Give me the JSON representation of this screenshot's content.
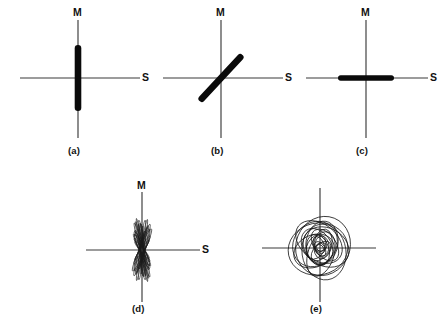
{
  "figure": {
    "background_color": "#ffffff",
    "line_color": "#3a3a3a",
    "mark_color": "#0a0a0a",
    "axis_label_vertical": "M",
    "axis_label_horizontal": "S"
  },
  "panels": [
    {
      "id": "a",
      "caption": "(a)",
      "label_m": "M",
      "label_s": "S",
      "description": "linear vertical particle motion",
      "motion_type": "linear",
      "orientation_deg": 90
    },
    {
      "id": "b",
      "caption": "(b)",
      "label_m": "M",
      "label_s": "S",
      "description": "linear oblique particle motion at about 45 degrees",
      "motion_type": "linear",
      "orientation_deg": 47
    },
    {
      "id": "c",
      "caption": "(c)",
      "label_m": "M",
      "label_s": "S",
      "description": "linear horizontal particle motion",
      "motion_type": "linear",
      "orientation_deg": 0
    },
    {
      "id": "d",
      "caption": "(d)",
      "label_m": "M",
      "label_s": "S",
      "description": "fan of narrow near-linear ellipses about the vertical axis",
      "motion_type": "near-linear-ellipses",
      "orientation_deg": 90
    },
    {
      "id": "e",
      "caption": "(e)",
      "label_m": "",
      "label_s": "",
      "description": "many overlapping elliptical and circular orbits",
      "motion_type": "elliptical-orbits",
      "orientation_deg": null
    }
  ],
  "chart_data": {
    "type": "scatter",
    "xlabel": "S",
    "ylabel": "M",
    "grid": false,
    "legend": "none",
    "panel_axes": {
      "a": {
        "x_min": -58,
        "x_max": 62,
        "y_min": -62,
        "y_max": 56
      },
      "b": {
        "x_min": -58,
        "x_max": 62,
        "y_min": -62,
        "y_max": 56
      },
      "c": {
        "x_min": -60,
        "x_max": 62,
        "y_min": -62,
        "y_max": 56
      },
      "d": {
        "x_min": -52,
        "x_max": 58,
        "y_min": -58,
        "y_max": 52
      },
      "e": {
        "x_min": -56,
        "x_max": 56,
        "y_min": -58,
        "y_max": 56
      }
    },
    "series": [
      {
        "name": "(a) vertical linear",
        "panel": "a",
        "kind": "bar",
        "angle_deg": 90,
        "half_length": 33,
        "width": 6.5
      },
      {
        "name": "(b) oblique linear",
        "panel": "b",
        "kind": "bar",
        "angle_deg": 47,
        "half_length": 31,
        "width": 6.5
      },
      {
        "name": "(c) horizontal linear",
        "panel": "c",
        "kind": "bar",
        "angle_deg": 0,
        "half_length": 28,
        "width": 5.5
      },
      {
        "name": "(d) near-linear ellipse fan",
        "panel": "d",
        "kind": "ellipses",
        "ellipses": [
          {
            "rx": 2.0,
            "ry": 30,
            "rot": -6
          },
          {
            "rx": 1.6,
            "ry": 27,
            "rot": 4
          },
          {
            "rx": 2.6,
            "ry": 25,
            "rot": -14
          },
          {
            "rx": 1.4,
            "ry": 32,
            "rot": 10
          },
          {
            "rx": 3.0,
            "ry": 22,
            "rot": -20
          },
          {
            "rx": 1.9,
            "ry": 28,
            "rot": 16
          },
          {
            "rx": 1.2,
            "ry": 24,
            "rot": -2
          },
          {
            "rx": 2.4,
            "ry": 20,
            "rot": 22
          },
          {
            "rx": 1.7,
            "ry": 31,
            "rot": -10
          },
          {
            "rx": 2.1,
            "ry": 18,
            "rot": 28
          },
          {
            "rx": 1.1,
            "ry": 26,
            "rot": 8
          },
          {
            "rx": 2.8,
            "ry": 23,
            "rot": -24
          },
          {
            "rx": 1.5,
            "ry": 29,
            "rot": 13
          },
          {
            "rx": 2.2,
            "ry": 16,
            "rot": -30
          },
          {
            "rx": 1.3,
            "ry": 21,
            "rot": 19
          },
          {
            "rx": 2.5,
            "ry": 27,
            "rot": -17
          },
          {
            "rx": 1.8,
            "ry": 14,
            "rot": 34
          },
          {
            "rx": 1.0,
            "ry": 19,
            "rot": -8
          },
          {
            "rx": 2.3,
            "ry": 30,
            "rot": 6
          },
          {
            "rx": 1.6,
            "ry": 12,
            "rot": -36
          },
          {
            "rx": 2.7,
            "ry": 17,
            "rot": 25
          },
          {
            "rx": 1.2,
            "ry": 23,
            "rot": -13
          },
          {
            "rx": 2.0,
            "ry": 11,
            "rot": 40
          },
          {
            "rx": 1.4,
            "ry": 26,
            "rot": 2
          }
        ]
      },
      {
        "name": "(e) elliptical orbits",
        "panel": "e",
        "kind": "ellipses",
        "ellipses": [
          {
            "rx": 30,
            "ry": 26,
            "rot": 12,
            "cx": -2,
            "cy": -1
          },
          {
            "rx": 27,
            "ry": 30,
            "rot": -22,
            "cx": 3,
            "cy": 2
          },
          {
            "rx": 24,
            "ry": 21,
            "rot": 48,
            "cx": -5,
            "cy": 4
          },
          {
            "rx": 22,
            "ry": 28,
            "rot": 8,
            "cx": 4,
            "cy": -4
          },
          {
            "rx": 26,
            "ry": 18,
            "rot": -38,
            "cx": -1,
            "cy": 6
          },
          {
            "rx": 19,
            "ry": 24,
            "rot": 62,
            "cx": 6,
            "cy": 1
          },
          {
            "rx": 21,
            "ry": 16,
            "rot": 25,
            "cx": -6,
            "cy": -3
          },
          {
            "rx": 16,
            "ry": 22,
            "rot": -10,
            "cx": 2,
            "cy": 5
          },
          {
            "rx": 23,
            "ry": 13,
            "rot": 72,
            "cx": 1,
            "cy": -6
          },
          {
            "rx": 14,
            "ry": 19,
            "rot": 35,
            "cx": -3,
            "cy": 2
          },
          {
            "rx": 18,
            "ry": 11,
            "rot": -55,
            "cx": 5,
            "cy": 3
          },
          {
            "rx": 11,
            "ry": 16,
            "rot": 18,
            "cx": -2,
            "cy": -2
          },
          {
            "rx": 15,
            "ry": 9,
            "rot": 80,
            "cx": 3,
            "cy": 4
          },
          {
            "rx": 9,
            "ry": 13,
            "rot": -28,
            "cx": -4,
            "cy": 1
          },
          {
            "rx": 12,
            "ry": 7,
            "rot": 45,
            "cx": 1,
            "cy": -3
          },
          {
            "rx": 7,
            "ry": 10,
            "rot": 5,
            "cx": 2,
            "cy": 2
          },
          {
            "rx": 9,
            "ry": 5,
            "rot": -65,
            "cx": -1,
            "cy": 3
          },
          {
            "rx": 5,
            "ry": 8,
            "rot": 30,
            "cx": 0,
            "cy": -1
          },
          {
            "rx": 6,
            "ry": 4,
            "rot": 15,
            "cx": 1,
            "cy": 1
          },
          {
            "rx": 4,
            "ry": 3,
            "rot": -40,
            "cx": 0,
            "cy": 0
          }
        ]
      }
    ]
  }
}
